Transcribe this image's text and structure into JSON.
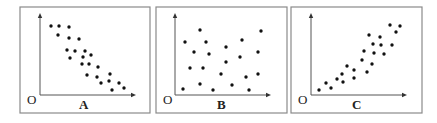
{
  "chart_data": [
    {
      "type": "scatter",
      "title": "",
      "panel_label": "A",
      "origin_label": "O",
      "xlabel": "",
      "ylabel": "",
      "grid": false,
      "legend": "none",
      "trend": "negative correlation",
      "frame": {
        "x": 20,
        "y": 7,
        "w": 130,
        "h": 106
      },
      "axes": {
        "ox": 40,
        "oy": 95,
        "x_end": 136,
        "y_end": 13
      },
      "label_pos": {
        "origin": [
          27,
          104
        ],
        "panel": [
          79,
          109
        ]
      },
      "points": [
        [
          51,
          26
        ],
        [
          59,
          26
        ],
        [
          69,
          27
        ],
        [
          58,
          35
        ],
        [
          69,
          38
        ],
        [
          79,
          39
        ],
        [
          67,
          50
        ],
        [
          75,
          51
        ],
        [
          85,
          51
        ],
        [
          91,
          55
        ],
        [
          70,
          58
        ],
        [
          83,
          57
        ],
        [
          82,
          64
        ],
        [
          89,
          64
        ],
        [
          98,
          67
        ],
        [
          87,
          75
        ],
        [
          97,
          77
        ],
        [
          110,
          74
        ],
        [
          101,
          83
        ],
        [
          109,
          81
        ],
        [
          119,
          83
        ],
        [
          112,
          90
        ],
        [
          124,
          88
        ]
      ]
    },
    {
      "type": "scatter",
      "title": "",
      "panel_label": "B",
      "origin_label": "O",
      "xlabel": "",
      "ylabel": "",
      "grid": false,
      "legend": "none",
      "trend": "no correlation",
      "frame": {
        "x": 156,
        "y": 7,
        "w": 131,
        "h": 106
      },
      "axes": {
        "ox": 175,
        "oy": 95,
        "x_end": 271,
        "y_end": 13
      },
      "label_pos": {
        "origin": [
          163,
          104
        ],
        "panel": [
          217,
          109
        ]
      },
      "points": [
        [
          200,
          30
        ],
        [
          261,
          31
        ],
        [
          185,
          42
        ],
        [
          206,
          42
        ],
        [
          242,
          40
        ],
        [
          226,
          47
        ],
        [
          194,
          52
        ],
        [
          209,
          54
        ],
        [
          240,
          57
        ],
        [
          258,
          52
        ],
        [
          226,
          62
        ],
        [
          190,
          68
        ],
        [
          203,
          68
        ],
        [
          221,
          74
        ],
        [
          246,
          77
        ],
        [
          258,
          74
        ],
        [
          183,
          89
        ],
        [
          200,
          84
        ],
        [
          213,
          90
        ],
        [
          232,
          85
        ],
        [
          249,
          90
        ]
      ]
    },
    {
      "type": "scatter",
      "title": "",
      "panel_label": "C",
      "origin_label": "O",
      "xlabel": "",
      "ylabel": "",
      "grid": false,
      "legend": "none",
      "trend": "positive correlation",
      "frame": {
        "x": 291,
        "y": 7,
        "w": 131,
        "h": 106
      },
      "axes": {
        "ox": 311,
        "oy": 95,
        "x_end": 407,
        "y_end": 13
      },
      "label_pos": {
        "origin": [
          298,
          104
        ],
        "panel": [
          352,
          109
        ]
      },
      "points": [
        [
          390,
          25
        ],
        [
          400,
          26
        ],
        [
          396,
          32
        ],
        [
          369,
          35
        ],
        [
          380,
          37
        ],
        [
          373,
          44
        ],
        [
          381,
          45
        ],
        [
          392,
          45
        ],
        [
          364,
          51
        ],
        [
          374,
          53
        ],
        [
          384,
          54
        ],
        [
          362,
          60
        ],
        [
          372,
          64
        ],
        [
          347,
          66
        ],
        [
          354,
          70
        ],
        [
          367,
          72
        ],
        [
          342,
          74
        ],
        [
          337,
          79
        ],
        [
          354,
          78
        ],
        [
          343,
          82
        ],
        [
          326,
          83
        ],
        [
          331,
          88
        ],
        [
          319,
          90
        ]
      ]
    }
  ],
  "style": {
    "frame_color": "#8a8a8a",
    "axis_color": "#555555",
    "point_color": "#111111",
    "text_color": "#222222",
    "background": "#ffffff"
  }
}
